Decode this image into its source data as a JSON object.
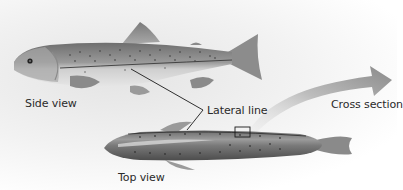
{
  "diagram": {
    "labels": {
      "side_view": "Side view",
      "lateral_line": "Lateral line",
      "cross_section": "Cross section",
      "top_view": "Top view"
    },
    "colors": {
      "fish_body": "#8a8a8a",
      "fish_dark": "#5a5a5a",
      "fish_belly": "#d8d8d8",
      "arrow": "#8c8c8c",
      "line": "#222222"
    }
  }
}
